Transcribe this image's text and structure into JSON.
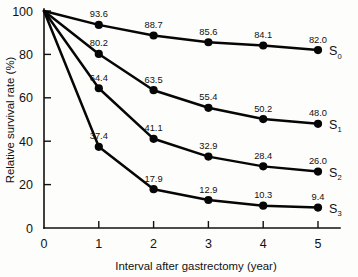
{
  "chart_data": {
    "type": "line",
    "title": "",
    "xlabel": "Interval after gastrectomy (year)",
    "ylabel": "Relative survival rate (%)",
    "x": [
      0,
      1,
      2,
      3,
      4,
      5
    ],
    "xticks": [
      "0",
      "1",
      "2",
      "3",
      "4",
      "5"
    ],
    "yticks": [
      "0",
      "20",
      "40",
      "60",
      "80",
      "100"
    ],
    "xlim": [
      0,
      5
    ],
    "ylim": [
      0,
      100
    ],
    "grid": false,
    "legend_position": "right-inline",
    "marker": "filled-circle",
    "line_color": "#060606",
    "series": [
      {
        "name": "S0",
        "label_main": "S",
        "label_sub": "0",
        "values": [
          100,
          93.6,
          88.7,
          85.6,
          84.1,
          82.0
        ],
        "point_labels": [
          "",
          "93.6",
          "88.7",
          "85.6",
          "84.1",
          "82.0"
        ]
      },
      {
        "name": "S1",
        "label_main": "S",
        "label_sub": "1",
        "values": [
          100,
          80.2,
          63.5,
          55.4,
          50.2,
          48.0
        ],
        "point_labels": [
          "",
          "80.2",
          "63.5",
          "55.4",
          "50.2",
          "48.0"
        ]
      },
      {
        "name": "S2",
        "label_main": "S",
        "label_sub": "2",
        "values": [
          100,
          64.4,
          41.1,
          32.9,
          28.4,
          26.0
        ],
        "point_labels": [
          "",
          "64.4",
          "41.1",
          "32.9",
          "28.4",
          "26.0"
        ]
      },
      {
        "name": "S3",
        "label_main": "S",
        "label_sub": "3",
        "values": [
          100,
          37.4,
          17.9,
          12.9,
          10.3,
          9.4
        ],
        "point_labels": [
          "",
          "37.4",
          "17.9",
          "12.9",
          "10.3",
          "9.4"
        ]
      }
    ]
  }
}
